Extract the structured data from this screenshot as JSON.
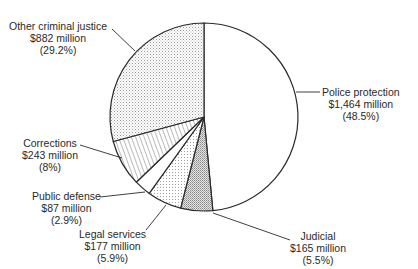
{
  "chart_data": {
    "type": "pie",
    "title": "",
    "start_angle": "12 o'clock",
    "direction": "clockwise",
    "unit": "million USD",
    "categories": [
      "Police protection",
      "Judicial",
      "Legal services",
      "Public defense",
      "Corrections",
      "Other criminal justice"
    ],
    "values": [
      1464,
      165,
      177,
      87,
      243,
      882
    ],
    "percentages": [
      48.5,
      5.5,
      5.9,
      2.9,
      8,
      29.2
    ],
    "slices": [
      {
        "name": "Police protection",
        "value_label": "$1,464 million",
        "pct_label": "(48.5%)",
        "pct": 48.5,
        "pattern": "blank"
      },
      {
        "name": "Judicial",
        "value_label": "$165 million",
        "pct_label": "(5.5%)",
        "pct": 5.5,
        "pattern": "dense-stipple"
      },
      {
        "name": "Legal services",
        "value_label": "$177 million",
        "pct_label": "(5.9%)",
        "pct": 5.9,
        "pattern": "light-dots"
      },
      {
        "name": "Public defense",
        "value_label": "$87 million",
        "pct_label": "(2.9%)",
        "pct": 2.9,
        "pattern": "blank"
      },
      {
        "name": "Corrections",
        "value_label": "$243 million",
        "pct_label": "(8%)",
        "pct": 8,
        "pattern": "hatch"
      },
      {
        "name": "Other criminal justice",
        "value_label": "$882 million",
        "pct_label": "(29.2%)",
        "pct": 29.2,
        "pattern": "light-stipple"
      }
    ],
    "legend": "none (direct labels with leader lines)"
  },
  "labels": {
    "police": {
      "name": "Police protection",
      "value": "$1,464 million",
      "pct": "(48.5%)"
    },
    "judicial": {
      "name": "Judicial",
      "value": "$165 million",
      "pct": "(5.5%)"
    },
    "legal": {
      "name": "Legal services",
      "value": "$177 million",
      "pct": "(5.9%)"
    },
    "defense": {
      "name": "Public defense",
      "value": "$87 million",
      "pct": "(2.9%)"
    },
    "corrections": {
      "name": "Corrections",
      "value": "$243 million",
      "pct": "(8%)"
    },
    "other": {
      "name": "Other criminal justice",
      "value": "$882 million",
      "pct": "(29.2%)"
    }
  },
  "colors": {
    "outline": "#2a2a2a",
    "stipple_light": "#9a9a9a",
    "stipple_dense": "#7a7a7a",
    "hatch": "#555555"
  }
}
